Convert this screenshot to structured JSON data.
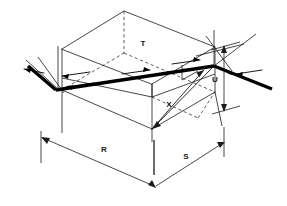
{
  "figure": {
    "type": "isometric-optical-cavity-line-drawing",
    "background_color": "#ffffff",
    "line_color": "#1a1a1a",
    "beam_color": "#000000",
    "labels": {
      "top_edge": "T",
      "vertical_right": "U",
      "diagonal_interior": "X",
      "base_left": "R",
      "base_right": "S"
    },
    "dimensions": {
      "width_px": 287,
      "height_px": 206
    },
    "elements": {
      "box": "wireframe-rectangular-box",
      "beam": "thick-folded-laser-beam",
      "mirrors": "two-end-mirrors",
      "hidden_edges": "dashed",
      "dimension_lines": [
        "R",
        "S",
        "U"
      ],
      "direction_arrows": 6
    }
  }
}
